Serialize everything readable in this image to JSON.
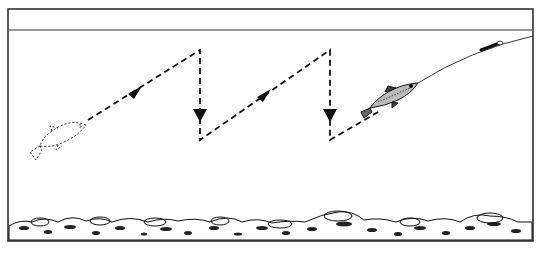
{
  "diagram": {
    "title": "Sink-and-draw retrieve with a baitfish lure",
    "colors": {
      "ink": "#111111",
      "background": "#ffffff",
      "frame": "#222222"
    },
    "frame": {
      "x": 8,
      "y": 9,
      "width": 525,
      "height": 232
    },
    "water_surface_y": 30,
    "path": {
      "points": [
        [
          88,
          120
        ],
        [
          200,
          50
        ],
        [
          200,
          140
        ],
        [
          330,
          50
        ],
        [
          330,
          140
        ],
        [
          378,
          112
        ]
      ],
      "arrows": [
        {
          "x": 136,
          "y": 92,
          "dir": "up-right"
        },
        {
          "x": 200,
          "y": 116,
          "dir": "down"
        },
        {
          "x": 265,
          "y": 95,
          "dir": "up-right"
        },
        {
          "x": 330,
          "y": 116,
          "dir": "down"
        }
      ]
    },
    "elements": [
      {
        "name": "start-fish-outline",
        "label": "Fish start position (dotted outline)"
      },
      {
        "name": "lure-fish",
        "label": "Lure fish on line"
      },
      {
        "name": "fishing-line",
        "label": "Line to rod"
      },
      {
        "name": "lake-bottom",
        "label": "Rocky bottom"
      }
    ]
  }
}
